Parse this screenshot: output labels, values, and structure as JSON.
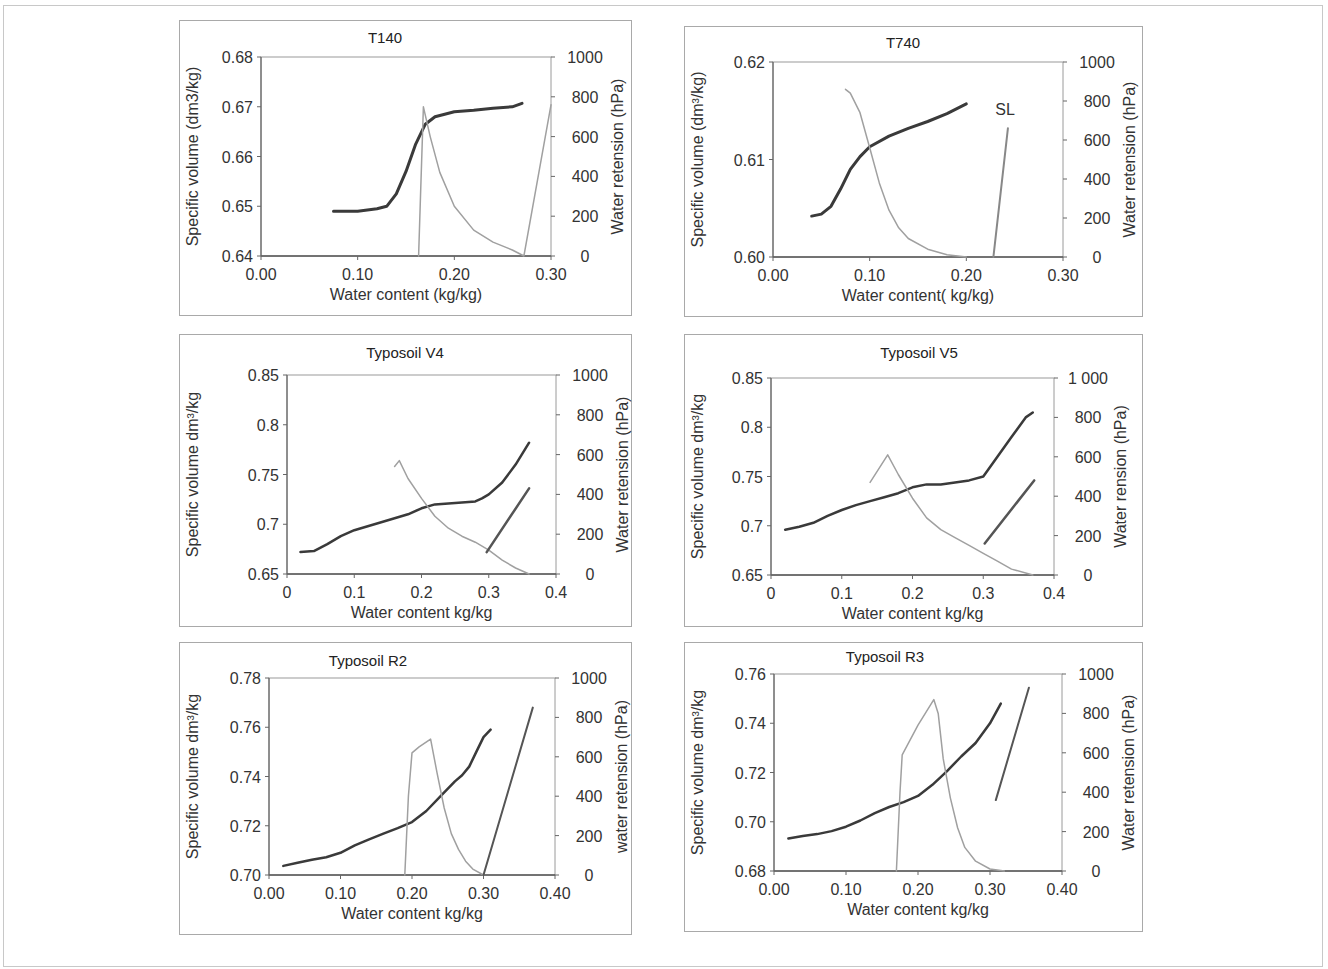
{
  "figure": {
    "panels": [
      {
        "id": "t140",
        "title": "T140",
        "ylabel_left": "Specific volume (dm3/kg)",
        "ylabel_right": "Water  retension  (hPa)",
        "xlabel": "Water content  (kg/kg)",
        "x_ticks": [
          "0.00",
          "0.10",
          "0.20",
          "0.30"
        ],
        "y_ticks": [
          "0.64",
          "0.65",
          "0.66",
          "0.67",
          "0.68"
        ],
        "y2_ticks": [
          "0",
          "200",
          "400",
          "600",
          "800",
          "1000"
        ]
      },
      {
        "id": "t740",
        "title": "T740",
        "ylabel_left": "Specific volume (dm³/kg)",
        "ylabel_right": "Water  retension  (hPa)",
        "xlabel": "Water content( kg/kg)",
        "x_ticks": [
          "0.00",
          "0.10",
          "0.20",
          "0.30"
        ],
        "y_ticks": [
          "0.60",
          "0.61",
          "0.62"
        ],
        "y2_ticks": [
          "0",
          "200",
          "400",
          "600",
          "800",
          "1000"
        ],
        "annotation": "SL"
      },
      {
        "id": "v4",
        "title": "Typosoil V4",
        "ylabel_left": "Specific volume dm³/kg",
        "ylabel_right": "Water retension  (hPa)",
        "xlabel": "Water content kg/kg",
        "x_ticks": [
          "0",
          "0.1",
          "0.2",
          "0.3",
          "0.4"
        ],
        "y_ticks": [
          "0.65",
          "0.7",
          "0.75",
          "0.8",
          "0.85"
        ],
        "y2_ticks": [
          "0",
          "200",
          "400",
          "600",
          "800",
          "1000"
        ]
      },
      {
        "id": "v5",
        "title": "Typosoil  V5",
        "ylabel_left": "Specific volume dm³/kg",
        "ylabel_right": "Water rension  (hPa)",
        "xlabel": "Water content kg/kg",
        "x_ticks": [
          "0",
          "0.1",
          "0.2",
          "0.3",
          "0.4"
        ],
        "y_ticks": [
          "0.65",
          "0.7",
          "0.75",
          "0.8",
          "0.85"
        ],
        "y2_ticks": [
          "0",
          "200",
          "400",
          "600",
          "800",
          "1 000"
        ]
      },
      {
        "id": "r2",
        "title": "Typosoil  R2",
        "ylabel_left": "Specific volume dm³/kg",
        "ylabel_right": "water  retension  (hPa)",
        "xlabel": "Water content kg/kg",
        "x_ticks": [
          "0.00",
          "0.10",
          "0.20",
          "0.30",
          "0.40"
        ],
        "y_ticks": [
          "0.70",
          "0.72",
          "0.74",
          "0.76",
          "0.78"
        ],
        "y2_ticks": [
          "0",
          "200",
          "400",
          "600",
          "800",
          "1000"
        ]
      },
      {
        "id": "r3",
        "title": "Typosoil R3",
        "ylabel_left": "Specific volume dm³/kg",
        "ylabel_right": "Water  retension  (hPa)",
        "xlabel": "Water content kg/kg",
        "x_ticks": [
          "0.00",
          "0.10",
          "0.20",
          "0.30",
          "0.40"
        ],
        "y_ticks": [
          "0.68",
          "0.70",
          "0.72",
          "0.74",
          "0.76"
        ],
        "y2_ticks": [
          "0",
          "200",
          "400",
          "600",
          "800",
          "1000"
        ]
      }
    ]
  },
  "chart_data": [
    {
      "type": "line",
      "title": "T140",
      "xlabel": "Water content  (kg/kg)",
      "ylabel": "Specific volume (dm3/kg)",
      "y2label": "Water  retension  (hPa)",
      "xlim": [
        0,
        0.3
      ],
      "ylim": [
        0.64,
        0.68
      ],
      "y2lim": [
        0,
        1000
      ],
      "grid": false,
      "series": [
        {
          "name": "Specific volume (shrinkage curve)",
          "axis": "left",
          "color": "#3a3a3a",
          "width": 3,
          "x": [
            0.075,
            0.1,
            0.12,
            0.13,
            0.14,
            0.15,
            0.16,
            0.17,
            0.18,
            0.19,
            0.2,
            0.22,
            0.24,
            0.26,
            0.27
          ],
          "y": [
            0.649,
            0.649,
            0.6495,
            0.65,
            0.6525,
            0.657,
            0.6625,
            0.6665,
            0.668,
            0.6685,
            0.669,
            0.6693,
            0.6697,
            0.67,
            0.6707
          ]
        },
        {
          "name": "Water retension",
          "axis": "right",
          "color": "#a0a0a0",
          "width": 1.5,
          "x": [
            0.163,
            0.165,
            0.168,
            0.175,
            0.185,
            0.2,
            0.22,
            0.24,
            0.26,
            0.268,
            0.272,
            0.3
          ],
          "y": [
            0,
            300,
            750,
            600,
            420,
            250,
            130,
            70,
            30,
            10,
            0,
            760
          ]
        }
      ]
    },
    {
      "type": "line",
      "title": "T740",
      "xlabel": "Water content( kg/kg)",
      "ylabel": "Specific volume (dm³/kg)",
      "y2label": "Water  retension  (hPa)",
      "xlim": [
        0,
        0.3
      ],
      "ylim": [
        0.6,
        0.62
      ],
      "y2lim": [
        0,
        1000
      ],
      "grid": false,
      "annotations": [
        {
          "text": "SL",
          "x": 0.24,
          "y2": 730
        }
      ],
      "series": [
        {
          "name": "Specific volume (shrinkage curve)",
          "axis": "left",
          "color": "#3a3a3a",
          "width": 3,
          "x": [
            0.04,
            0.05,
            0.06,
            0.07,
            0.08,
            0.09,
            0.1,
            0.12,
            0.14,
            0.16,
            0.18,
            0.2
          ],
          "y": [
            0.6042,
            0.6044,
            0.6052,
            0.607,
            0.609,
            0.6103,
            0.6113,
            0.6124,
            0.6132,
            0.6139,
            0.6147,
            0.6157
          ]
        },
        {
          "name": "Water retension",
          "axis": "right",
          "color": "#a0a0a0",
          "width": 1.5,
          "x": [
            0.075,
            0.08,
            0.09,
            0.1,
            0.11,
            0.12,
            0.13,
            0.14,
            0.16,
            0.18,
            0.2
          ],
          "y": [
            860,
            840,
            740,
            560,
            380,
            240,
            150,
            95,
            40,
            12,
            0
          ]
        },
        {
          "name": "SL line",
          "axis": "right",
          "color": "#888888",
          "width": 2,
          "x": [
            0.228,
            0.243
          ],
          "y": [
            0,
            660
          ]
        }
      ]
    },
    {
      "type": "line",
      "title": "Typosoil V4",
      "xlabel": "Water content kg/kg",
      "ylabel": "Specific volume dm³/kg",
      "y2label": "Water retension  (hPa)",
      "xlim": [
        0,
        0.4
      ],
      "ylim": [
        0.65,
        0.85
      ],
      "y2lim": [
        0,
        1000
      ],
      "grid": false,
      "series": [
        {
          "name": "Specific volume (shrinkage curve)",
          "axis": "left",
          "color": "#3a3a3a",
          "width": 2.5,
          "x": [
            0.02,
            0.04,
            0.06,
            0.08,
            0.1,
            0.12,
            0.14,
            0.16,
            0.18,
            0.2,
            0.22,
            0.24,
            0.26,
            0.28,
            0.29,
            0.3,
            0.32,
            0.34,
            0.36
          ],
          "y": [
            0.672,
            0.673,
            0.68,
            0.688,
            0.694,
            0.698,
            0.702,
            0.706,
            0.71,
            0.716,
            0.72,
            0.721,
            0.722,
            0.723,
            0.726,
            0.73,
            0.742,
            0.76,
            0.782
          ]
        },
        {
          "name": "Water retension",
          "axis": "right",
          "color": "#a0a0a0",
          "width": 1.5,
          "x": [
            0.16,
            0.167,
            0.18,
            0.2,
            0.22,
            0.24,
            0.26,
            0.28,
            0.3,
            0.32,
            0.34,
            0.36
          ],
          "y": [
            540,
            570,
            480,
            380,
            290,
            230,
            190,
            160,
            120,
            70,
            30,
            0
          ]
        },
        {
          "name": "Saturation line",
          "axis": "right",
          "color": "#555555",
          "width": 2.5,
          "x": [
            0.297,
            0.36
          ],
          "y": [
            110,
            430
          ]
        }
      ]
    },
    {
      "type": "line",
      "title": "Typosoil  V5",
      "xlabel": "Water content kg/kg",
      "ylabel": "Specific volume dm³/kg",
      "y2label": "Water rension  (hPa)",
      "xlim": [
        0,
        0.4
      ],
      "ylim": [
        0.65,
        0.85
      ],
      "y2lim": [
        0,
        1000
      ],
      "grid": false,
      "series": [
        {
          "name": "Specific volume (shrinkage curve)",
          "axis": "left",
          "color": "#3a3a3a",
          "width": 2.5,
          "x": [
            0.02,
            0.04,
            0.06,
            0.08,
            0.1,
            0.12,
            0.14,
            0.16,
            0.18,
            0.2,
            0.22,
            0.24,
            0.26,
            0.28,
            0.3,
            0.32,
            0.34,
            0.36,
            0.37
          ],
          "y": [
            0.696,
            0.699,
            0.703,
            0.71,
            0.716,
            0.721,
            0.725,
            0.729,
            0.733,
            0.739,
            0.742,
            0.742,
            0.744,
            0.746,
            0.75,
            0.77,
            0.79,
            0.81,
            0.815
          ]
        },
        {
          "name": "Water retension",
          "axis": "right",
          "color": "#a0a0a0",
          "width": 1.5,
          "x": [
            0.14,
            0.165,
            0.18,
            0.2,
            0.22,
            0.24,
            0.26,
            0.28,
            0.3,
            0.32,
            0.34,
            0.37
          ],
          "y": [
            470,
            610,
            510,
            390,
            290,
            230,
            190,
            150,
            110,
            70,
            30,
            0
          ]
        },
        {
          "name": "Saturation line",
          "axis": "right",
          "color": "#555555",
          "width": 2.5,
          "x": [
            0.302,
            0.372
          ],
          "y": [
            160,
            480
          ]
        }
      ]
    },
    {
      "type": "line",
      "title": "Typosoil  R2",
      "xlabel": "Water content kg/kg",
      "ylabel": "Specific volume dm³/kg",
      "y2label": "water  retension  (hPa)",
      "xlim": [
        0,
        0.4
      ],
      "ylim": [
        0.7,
        0.78
      ],
      "y2lim": [
        0,
        1000
      ],
      "grid": false,
      "series": [
        {
          "name": "Specific volume (shrinkage curve)",
          "axis": "left",
          "color": "#3a3a3a",
          "width": 2.5,
          "x": [
            0.02,
            0.04,
            0.06,
            0.08,
            0.1,
            0.12,
            0.14,
            0.16,
            0.18,
            0.2,
            0.22,
            0.24,
            0.26,
            0.27,
            0.28,
            0.29,
            0.3,
            0.31
          ],
          "y": [
            0.7037,
            0.705,
            0.7062,
            0.7072,
            0.709,
            0.712,
            0.7145,
            0.7168,
            0.719,
            0.7215,
            0.726,
            0.732,
            0.738,
            0.7405,
            0.744,
            0.75,
            0.756,
            0.759
          ]
        },
        {
          "name": "Water retension",
          "axis": "right",
          "color": "#a0a0a0",
          "width": 1.5,
          "x": [
            0.19,
            0.195,
            0.2,
            0.21,
            0.226,
            0.235,
            0.245,
            0.255,
            0.265,
            0.275,
            0.285,
            0.3
          ],
          "y": [
            0,
            400,
            620,
            650,
            690,
            520,
            340,
            210,
            130,
            70,
            30,
            0
          ]
        },
        {
          "name": "Saturation line",
          "axis": "right",
          "color": "#555555",
          "width": 2,
          "x": [
            0.3,
            0.369
          ],
          "y": [
            0,
            850
          ]
        }
      ]
    },
    {
      "type": "line",
      "title": "Typosoil R3",
      "xlabel": "Water content kg/kg",
      "ylabel": "Specific volume dm³/kg",
      "y2label": "Water  retension  (hPa)",
      "xlim": [
        0,
        0.4
      ],
      "ylim": [
        0.68,
        0.76
      ],
      "y2lim": [
        0,
        1000
      ],
      "grid": false,
      "series": [
        {
          "name": "Specific volume (shrinkage curve)",
          "axis": "left",
          "color": "#3a3a3a",
          "width": 2.5,
          "x": [
            0.02,
            0.04,
            0.06,
            0.08,
            0.1,
            0.12,
            0.14,
            0.16,
            0.18,
            0.2,
            0.22,
            0.24,
            0.26,
            0.28,
            0.3,
            0.315
          ],
          "y": [
            0.6932,
            0.6942,
            0.695,
            0.6962,
            0.698,
            0.7005,
            0.7035,
            0.706,
            0.708,
            0.7105,
            0.715,
            0.7205,
            0.7265,
            0.732,
            0.74,
            0.748
          ]
        },
        {
          "name": "Water retension",
          "axis": "right",
          "color": "#a0a0a0",
          "width": 1.5,
          "x": [
            0.17,
            0.175,
            0.178,
            0.2,
            0.222,
            0.228,
            0.235,
            0.245,
            0.255,
            0.265,
            0.28,
            0.3,
            0.32
          ],
          "y": [
            0,
            400,
            590,
            740,
            870,
            800,
            570,
            370,
            220,
            120,
            50,
            10,
            0
          ]
        },
        {
          "name": "Saturation line",
          "axis": "right",
          "color": "#555555",
          "width": 2,
          "x": [
            0.308,
            0.354
          ],
          "y": [
            360,
            930
          ]
        }
      ]
    }
  ]
}
